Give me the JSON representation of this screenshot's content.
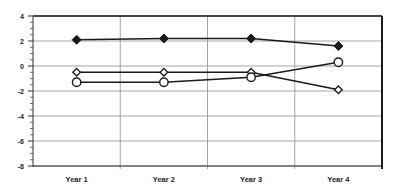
{
  "chart_data": {
    "type": "line",
    "title": "",
    "xlabel": "",
    "ylabel": "",
    "categories": [
      "Year 1",
      "Year 2",
      "Year 3",
      "Year 4"
    ],
    "ylim": [
      -8,
      4
    ],
    "yticks": [
      4,
      2,
      0,
      -2,
      -4,
      -6,
      -8
    ],
    "grid": true,
    "legend": null,
    "series": [
      {
        "name": "Series 1",
        "marker": "filled-diamond",
        "values": [
          2.1,
          2.2,
          2.2,
          1.6
        ]
      },
      {
        "name": "Series 2",
        "marker": "open-diamond",
        "values": [
          -0.5,
          -0.5,
          -0.5,
          -1.9
        ]
      },
      {
        "name": "Series 3",
        "marker": "open-circle",
        "values": [
          -1.3,
          -1.3,
          -0.9,
          0.3
        ]
      }
    ]
  },
  "colors": {
    "line": "#1a1a1a",
    "grid": "#9a9a9a",
    "axis": "#333333",
    "background": "#ffffff"
  }
}
